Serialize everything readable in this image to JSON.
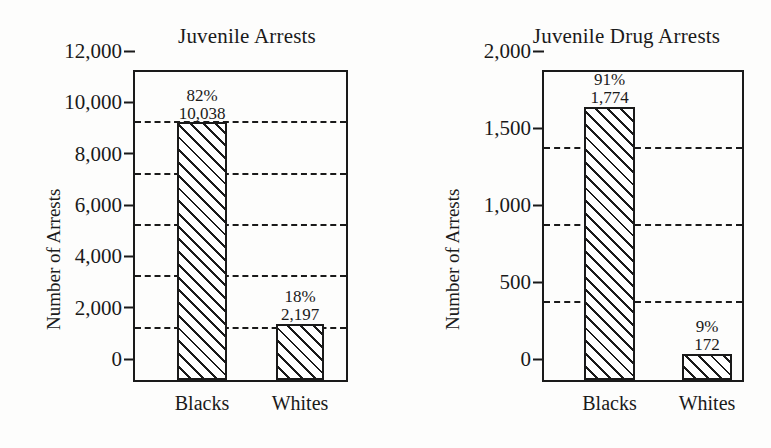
{
  "chart_data": [
    {
      "type": "bar",
      "title": "Juvenile Arrests",
      "xlabel": "",
      "ylabel": "Number of Arrests",
      "categories": [
        "Blacks",
        "Whites"
      ],
      "values": [
        10038,
        2197
      ],
      "value_labels": [
        "10,038",
        "2,197"
      ],
      "percent_labels": [
        "82%",
        "18%"
      ],
      "ylim": [
        0,
        12000
      ],
      "yticks": [
        0,
        2000,
        4000,
        6000,
        8000,
        10000,
        12000
      ],
      "ytick_labels": [
        "0",
        "2,000",
        "4,000",
        "6,000",
        "8,000",
        "10,000",
        "12,000"
      ],
      "grid": true,
      "gridlines_at": [
        2000,
        4000,
        6000,
        8000,
        10000
      ],
      "legend": "none"
    },
    {
      "type": "bar",
      "title": "Juvenile Drug Arrests",
      "xlabel": "",
      "ylabel": "Number of Arrests",
      "categories": [
        "Blacks",
        "Whites"
      ],
      "values": [
        1774,
        172
      ],
      "value_labels": [
        "1,774",
        "172"
      ],
      "percent_labels": [
        "91%",
        "9%"
      ],
      "ylim": [
        0,
        2000
      ],
      "yticks": [
        0,
        500,
        1000,
        1500,
        2000
      ],
      "ytick_labels": [
        "0",
        "500",
        "1,000",
        "1,500",
        "2,000"
      ],
      "grid": true,
      "gridlines_at": [
        500,
        1000,
        1500
      ],
      "legend": "none"
    }
  ],
  "charts": {
    "left": {
      "title": "Juvenile Arrests",
      "y_axis_title": "Number of Arrests",
      "yticks": [
        {
          "label": "12,000",
          "pct": 100
        },
        {
          "label": "10,000",
          "pct": 83.33
        },
        {
          "label": "8,000",
          "pct": 66.67
        },
        {
          "label": "6,000",
          "pct": 50
        },
        {
          "label": "4,000",
          "pct": 33.33
        },
        {
          "label": "2,000",
          "pct": 16.67
        },
        {
          "label": "0",
          "pct": 0
        }
      ],
      "gridlines": [
        {
          "pct": 83.33
        },
        {
          "pct": 66.67
        },
        {
          "pct": 50
        },
        {
          "pct": 33.33
        },
        {
          "pct": 16.67
        }
      ],
      "bars": [
        {
          "category": "Blacks",
          "percent": "82%",
          "value": "10,038",
          "height_pct": 83.65,
          "left_px": 42,
          "width_px": 50
        },
        {
          "category": "Whites",
          "percent": "18%",
          "value": "2,197",
          "height_pct": 18.31,
          "left_px": 141,
          "width_px": 48
        }
      ]
    },
    "right": {
      "title": "Juvenile Drug Arrests",
      "y_axis_title": "Number of Arrests",
      "yticks": [
        {
          "label": "2,000",
          "pct": 100
        },
        {
          "label": "1,500",
          "pct": 75
        },
        {
          "label": "1,000",
          "pct": 50
        },
        {
          "label": "500",
          "pct": 25
        },
        {
          "label": "0",
          "pct": 0
        }
      ],
      "gridlines": [
        {
          "pct": 75
        },
        {
          "pct": 50
        },
        {
          "pct": 25
        }
      ],
      "bars": [
        {
          "category": "Blacks",
          "percent": "91%",
          "value": "1,774",
          "height_pct": 88.7,
          "left_px": 40,
          "width_px": 51
        },
        {
          "category": "Whites",
          "percent": "9%",
          "value": "172",
          "height_pct": 8.6,
          "left_px": 138,
          "width_px": 50
        }
      ]
    }
  }
}
